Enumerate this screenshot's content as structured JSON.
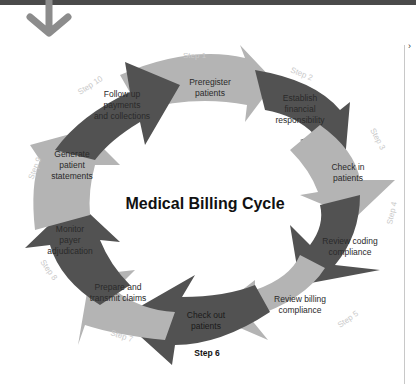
{
  "diagram": {
    "title": "Medical Billing Cycle",
    "colors": {
      "light": "#b4b4b4",
      "dark": "#525252",
      "bar": "#4a4a4a",
      "arrow": "#8c8c8c"
    },
    "steps": [
      {
        "step": "Step 1",
        "label_lines": [
          "Preregister",
          "patients"
        ]
      },
      {
        "step": "Step 2",
        "label_lines": [
          "Establish",
          "financial",
          "responsibility"
        ]
      },
      {
        "step": "Step 3",
        "label_lines": [
          "Check in",
          "patients"
        ]
      },
      {
        "step": "Step 4",
        "label_lines": [
          "Review coding",
          "compliance"
        ]
      },
      {
        "step": "Step 5",
        "label_lines": [
          "Review billing",
          "compliance"
        ]
      },
      {
        "step": "Step 6",
        "label_lines": [
          "Check out",
          "patients"
        ]
      },
      {
        "step": "Step 7",
        "label_lines": [
          "Prepare and",
          "transmit claims"
        ]
      },
      {
        "step": "Step 8",
        "label_lines": [
          "Monitor",
          "payer",
          "adjudication"
        ]
      },
      {
        "step": "Step 9",
        "label_lines": [
          "Generate",
          "patient",
          "statements"
        ]
      },
      {
        "step": "Step 10",
        "label_lines": [
          "Follow up",
          "payments",
          "and collections"
        ]
      }
    ]
  },
  "ui": {
    "collapse_chevron": "›"
  }
}
